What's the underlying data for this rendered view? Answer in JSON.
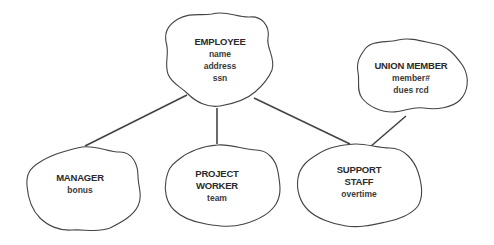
{
  "diagram": {
    "type": "class-hierarchy",
    "nodes": [
      {
        "id": "employee",
        "title": [
          "EMPLOYEE"
        ],
        "attributes": [
          "name",
          "address",
          "ssn"
        ]
      },
      {
        "id": "union_member",
        "title": [
          "UNION MEMBER"
        ],
        "attributes": [
          "member#",
          "dues rcd"
        ]
      },
      {
        "id": "manager",
        "title": [
          "MANAGER"
        ],
        "attributes": [
          "bonus"
        ]
      },
      {
        "id": "project_worker",
        "title": [
          "PROJECT",
          "WORKER"
        ],
        "attributes": [
          "team"
        ]
      },
      {
        "id": "support_staff",
        "title": [
          "SUPPORT",
          "STAFF"
        ],
        "attributes": [
          "overtime"
        ]
      }
    ],
    "edges": [
      {
        "from": "employee",
        "to": "manager"
      },
      {
        "from": "employee",
        "to": "project_worker"
      },
      {
        "from": "employee",
        "to": "support_staff"
      },
      {
        "from": "union_member",
        "to": "support_staff"
      }
    ],
    "colors": {
      "stroke": "#444444",
      "text": "#2b2b2b",
      "background": "#ffffff"
    }
  }
}
